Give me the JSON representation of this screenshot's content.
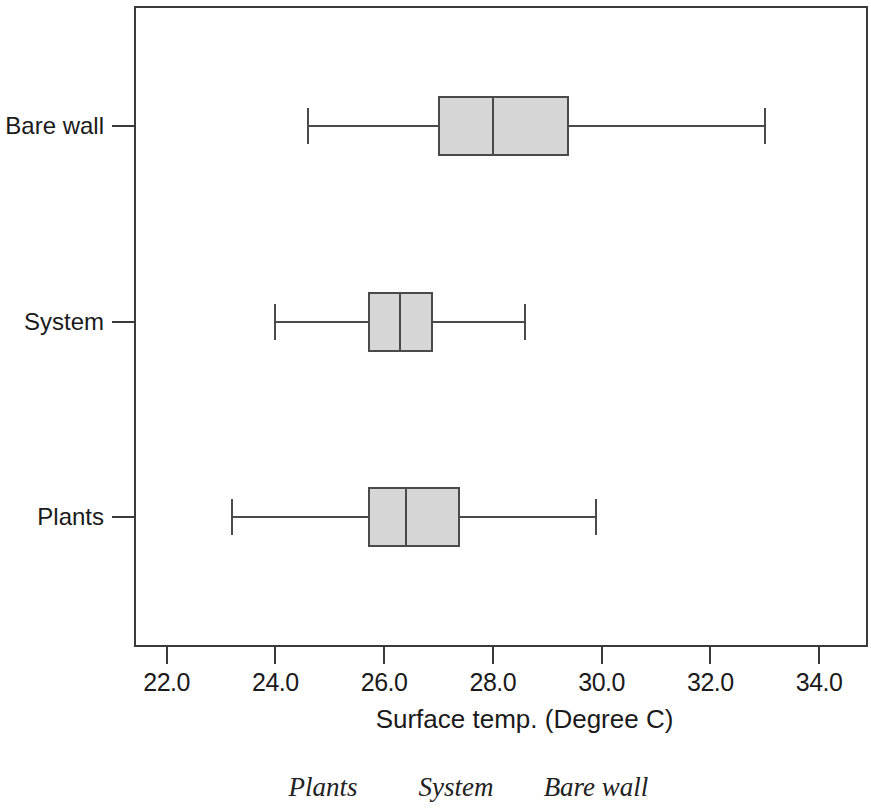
{
  "chart_data": {
    "type": "box",
    "orientation": "horizontal",
    "title": "",
    "xlabel": "Surface temp. (Degree C)",
    "ylabel": "",
    "xlim": [
      21.4,
      34.9
    ],
    "xticks": [
      "22.0",
      "24.0",
      "26.0",
      "28.0",
      "30.0",
      "32.0",
      "34.0"
    ],
    "xtick_values": [
      22.0,
      24.0,
      26.0,
      28.0,
      30.0,
      32.0,
      34.0
    ],
    "categories": [
      "Bare wall",
      "System",
      "Plants"
    ],
    "grid": false,
    "legend": "none",
    "box_fill_color": "#d6d6d6",
    "line_color": "#4a4a4a",
    "boxes": [
      {
        "category": "Bare wall",
        "whisker_low": 24.6,
        "q1": 27.0,
        "median": 28.0,
        "q3": 29.4,
        "whisker_high": 33.0
      },
      {
        "category": "System",
        "whisker_low": 24.0,
        "q1": 25.7,
        "median": 26.3,
        "q3": 26.9,
        "whisker_high": 28.6
      },
      {
        "category": "Plants",
        "whisker_low": 23.2,
        "q1": 25.7,
        "median": 26.4,
        "q3": 27.4,
        "whisker_high": 29.9
      }
    ]
  },
  "caption": {
    "items": [
      "Plants",
      "System",
      "Bare wall"
    ]
  }
}
